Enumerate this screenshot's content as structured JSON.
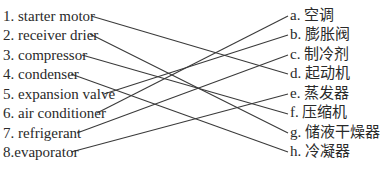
{
  "exercise": {
    "left_items": [
      {
        "label": "1. starter motor",
        "y": 8
      },
      {
        "label": "2. receiver drier",
        "y": 27
      },
      {
        "label": "3. compressor",
        "y": 47
      },
      {
        "label": "4. condenser",
        "y": 66
      },
      {
        "label": "5. expansion valve",
        "y": 86
      },
      {
        "label": "6. air conditioner",
        "y": 105
      },
      {
        "label": "7. refrigerant",
        "y": 125
      },
      {
        "label": "8.evaporator",
        "y": 144
      }
    ],
    "right_items": [
      {
        "label": "a. 空调",
        "y": 7
      },
      {
        "label": "b. 膨胀阀",
        "y": 26
      },
      {
        "label": "c. 制冷剂",
        "y": 46
      },
      {
        "label": "d. 起动机",
        "y": 65
      },
      {
        "label": "e. 蒸发器",
        "y": 85
      },
      {
        "label": "f. 压缩机",
        "y": 104
      },
      {
        "label": "g. 储液干燥器",
        "y": 124
      },
      {
        "label": "h. 冷凝器",
        "y": 143
      }
    ],
    "matches": [
      {
        "from": "1",
        "to": "d"
      },
      {
        "from": "2",
        "to": "g"
      },
      {
        "from": "3",
        "to": "f"
      },
      {
        "from": "4",
        "to": "h"
      },
      {
        "from": "5",
        "to": "b"
      },
      {
        "from": "6",
        "to": "a"
      },
      {
        "from": "7",
        "to": "c"
      },
      {
        "from": "8",
        "to": "e"
      }
    ]
  }
}
